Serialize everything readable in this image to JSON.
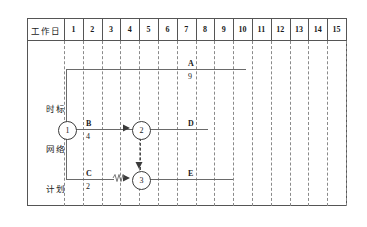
{
  "topnote": " ",
  "table": {
    "header_label": "工作日",
    "columns": [
      "1",
      "2",
      "3",
      "4",
      "5",
      "6",
      "7",
      "8",
      "9",
      "10",
      "11",
      "12",
      "13",
      "14",
      "15"
    ]
  },
  "rows": [
    {
      "label": "时标"
    },
    {
      "label": "网络"
    },
    {
      "label": "计划"
    }
  ],
  "diagram": {
    "nodes": [
      {
        "id": "1",
        "label": "1"
      },
      {
        "id": "2",
        "label": "2"
      },
      {
        "id": "3",
        "label": "3"
      }
    ],
    "activities": [
      {
        "name": "A",
        "duration": "9"
      },
      {
        "name": "B",
        "duration": "4"
      },
      {
        "name": "C",
        "duration": "2"
      },
      {
        "name": "D",
        "duration": ""
      },
      {
        "name": "E",
        "duration": ""
      }
    ]
  },
  "colors": {
    "frame": "#555555",
    "grid": "#8a8a8a",
    "line": "#6a6a6a",
    "node": "#3a3a3a",
    "text": "#1a1a1a"
  }
}
